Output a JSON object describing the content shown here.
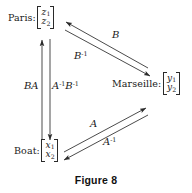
{
  "figure": {
    "caption": "Figure 8",
    "stroke_color": "#2a2a2a",
    "text_color": "#1a1a1a",
    "background_color": "#ffffff"
  },
  "nodes": [
    {
      "id": "paris",
      "label": "Paris:",
      "vector": {
        "top": "z",
        "top_sub": "1",
        "bottom": "z",
        "bottom_sub": "2"
      }
    },
    {
      "id": "marseille",
      "label": "Marseille:",
      "vector": {
        "top": "y",
        "top_sub": "1",
        "bottom": "y",
        "bottom_sub": "2"
      }
    },
    {
      "id": "boat",
      "label": "Boat:",
      "vector": {
        "top": "x",
        "top_sub": "1",
        "bottom": "x",
        "bottom_sub": "2"
      }
    }
  ],
  "edges": [
    {
      "id": "b",
      "base": "B",
      "exponent": "",
      "from": "marseille",
      "to": "paris"
    },
    {
      "id": "b-inv",
      "base": "B",
      "exponent": "-1",
      "from": "paris",
      "to": "marseille"
    },
    {
      "id": "ba",
      "base": "BA",
      "exponent": "",
      "from": "boat",
      "to": "paris"
    },
    {
      "id": "abinv",
      "base": "A",
      "exponent": "-1",
      "base2": "B",
      "exponent2": "-1",
      "from": "paris",
      "to": "boat"
    },
    {
      "id": "a",
      "base": "A",
      "exponent": "",
      "from": "boat",
      "to": "marseille"
    },
    {
      "id": "a-inv",
      "base": "A",
      "exponent": "-1",
      "from": "marseille",
      "to": "boat"
    }
  ]
}
